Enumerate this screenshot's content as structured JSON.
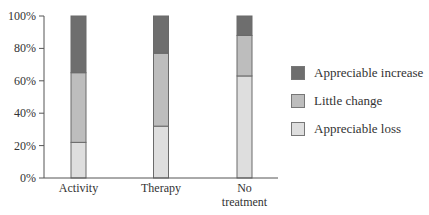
{
  "chart_data": {
    "type": "bar",
    "stacked": true,
    "percent": true,
    "title": "",
    "xlabel": "",
    "ylabel": "",
    "ylim": [
      0,
      100
    ],
    "yticks": [
      "0%",
      "20%",
      "40%",
      "60%",
      "80%",
      "100%"
    ],
    "categories": [
      "Activity",
      "Therapy",
      "No treatment"
    ],
    "category_lines": [
      [
        "Activity"
      ],
      [
        "Therapy"
      ],
      [
        "No",
        "treatment"
      ]
    ],
    "series": [
      {
        "name": "Appreciable loss",
        "color": "#dedede",
        "values": [
          22,
          32,
          63
        ]
      },
      {
        "name": "Little change",
        "color": "#bdbdbd",
        "values": [
          43,
          45,
          25
        ]
      },
      {
        "name": "Appreciable increase",
        "color": "#6e6e6e",
        "values": [
          35,
          23,
          12
        ]
      }
    ],
    "grid": false,
    "legend_position": "right"
  },
  "legend": {
    "items": [
      {
        "label": "Appreciable increase",
        "color": "#6e6e6e"
      },
      {
        "label": "Little change",
        "color": "#bdbdbd"
      },
      {
        "label": "Appreciable loss",
        "color": "#dedede"
      }
    ]
  }
}
